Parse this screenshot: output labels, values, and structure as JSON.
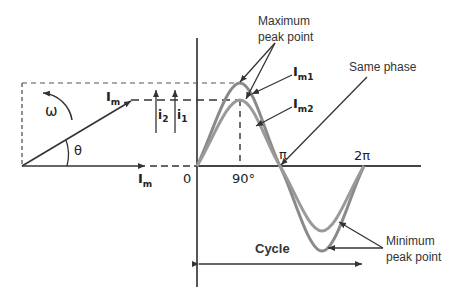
{
  "diagram": {
    "labels": {
      "max_peak_line1": "Maximum",
      "max_peak_line2": "peak point",
      "im1": "I",
      "im1_sub": "m1",
      "im2": "I",
      "im2_sub": "m2",
      "same_phase": "Same phase",
      "min_peak_line1": "Minimum",
      "min_peak_line2": "peak point",
      "cycle": "Cycle",
      "im_phasor": "I",
      "im_phasor_sub": "m",
      "im_axis": "I",
      "im_axis_sub": "m",
      "omega": "ω",
      "theta": "θ",
      "i2": "i",
      "i2_sub": "2",
      "i1": "i",
      "i1_sub": "1",
      "origin": "0",
      "deg90": "90°",
      "pi": "π",
      "two_pi": "2π"
    },
    "colors": {
      "axis": "#444444",
      "wave": "#8a8a8a",
      "text": "#333333"
    }
  }
}
